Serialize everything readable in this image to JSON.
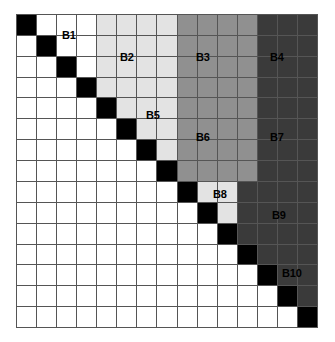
{
  "figure": {
    "type": "block-matrix-diagram",
    "title": "",
    "grid": {
      "rows": 15,
      "cols": 15,
      "gridline_color": "#555555",
      "background": "#ffffff"
    },
    "palette": {
      "diagonal": "#000000",
      "white": "#ffffff",
      "light_gray": "#e3e3e3",
      "medium_gray": "#909090",
      "dark_gray": "#3a3a3a"
    },
    "blocks": [
      {
        "id": "B1",
        "label": "B1",
        "color_key": "white",
        "hex": "#ffffff",
        "row_start": 1,
        "row_end": 4,
        "col_start": 1,
        "col_end": 4
      },
      {
        "id": "B2",
        "label": "B2",
        "color_key": "light_gray",
        "hex": "#e3e3e3",
        "row_start": 1,
        "row_end": 4,
        "col_start": 5,
        "col_end": 8
      },
      {
        "id": "B3",
        "label": "B3",
        "color_key": "medium_gray",
        "hex": "#909090",
        "row_start": 1,
        "row_end": 4,
        "col_start": 9,
        "col_end": 12
      },
      {
        "id": "B4",
        "label": "B4",
        "color_key": "dark_gray",
        "hex": "#3a3a3a",
        "row_start": 1,
        "row_end": 4,
        "col_start": 13,
        "col_end": 15
      },
      {
        "id": "B5",
        "label": "B5",
        "color_key": "light_gray",
        "hex": "#e3e3e3",
        "row_start": 5,
        "row_end": 8,
        "col_start": 5,
        "col_end": 8
      },
      {
        "id": "B6",
        "label": "B6",
        "color_key": "medium_gray",
        "hex": "#909090",
        "row_start": 5,
        "row_end": 8,
        "col_start": 9,
        "col_end": 12
      },
      {
        "id": "B7",
        "label": "B7",
        "color_key": "dark_gray",
        "hex": "#3a3a3a",
        "row_start": 5,
        "row_end": 8,
        "col_start": 13,
        "col_end": 15
      },
      {
        "id": "B8",
        "label": "B8",
        "color_key": "light_gray",
        "hex": "#e3e3e3",
        "row_start": 9,
        "row_end": 11,
        "col_start": 9,
        "col_end": 11
      },
      {
        "id": "B9",
        "label": "B9",
        "color_key": "dark_gray",
        "hex": "#3a3a3a",
        "row_start": 9,
        "row_end": 11,
        "col_start": 12,
        "col_end": 15
      },
      {
        "id": "B10",
        "label": "B10",
        "color_key": "dark_gray",
        "hex": "#3a3a3a",
        "row_start": 12,
        "row_end": 15,
        "col_start": 12,
        "col_end": 15
      }
    ],
    "labels": [
      {
        "text": "B1",
        "x": 62,
        "y": 30
      },
      {
        "text": "B2",
        "x": 120,
        "y": 52
      },
      {
        "text": "B3",
        "x": 196,
        "y": 52
      },
      {
        "text": "B4",
        "x": 270,
        "y": 52
      },
      {
        "text": "B5",
        "x": 146,
        "y": 110
      },
      {
        "text": "B6",
        "x": 196,
        "y": 132
      },
      {
        "text": "B7",
        "x": 270,
        "y": 132
      },
      {
        "text": "B8",
        "x": 213,
        "y": 189
      },
      {
        "text": "B9",
        "x": 272,
        "y": 210
      },
      {
        "text": "B10",
        "x": 282,
        "y": 268
      }
    ]
  }
}
